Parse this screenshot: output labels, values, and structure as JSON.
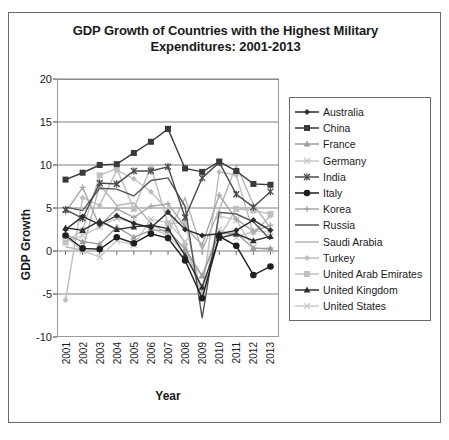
{
  "chart_data": {
    "type": "line",
    "title": "GDP Growth of Countries with the Highest Military Expenditures: 2001-2013",
    "title_line1": "GDP Growth of Countries with the Highest Military",
    "title_line2": "Expenditures: 2001-2013",
    "xlabel": "Year",
    "ylabel": "GDP Growth",
    "grid": true,
    "legend_position": "right",
    "ylim": [
      -10,
      20
    ],
    "yticks": [
      20,
      15,
      10,
      5,
      0,
      -5,
      -10
    ],
    "categories": [
      "2001",
      "2002",
      "2003",
      "2004",
      "2005",
      "2006",
      "2007",
      "2008",
      "2009",
      "2010",
      "2011",
      "2012",
      "2013"
    ],
    "series": [
      {
        "name": "Australia",
        "marker": "diamond",
        "color": "#2b2b2b",
        "values": [
          2.5,
          4.0,
          3.1,
          4.1,
          3.2,
          2.7,
          4.5,
          2.5,
          1.8,
          2.0,
          2.4,
          3.6,
          2.4
        ]
      },
      {
        "name": "China",
        "marker": "square",
        "color": "#3a3a3a",
        "values": [
          8.3,
          9.1,
          10.0,
          10.1,
          11.4,
          12.7,
          14.2,
          9.6,
          9.2,
          10.4,
          9.3,
          7.8,
          7.7
        ]
      },
      {
        "name": "France",
        "marker": "triangle",
        "color": "#9c9c9c",
        "values": [
          1.9,
          1.1,
          0.8,
          2.8,
          1.6,
          2.4,
          2.4,
          0.2,
          -2.9,
          2.0,
          2.1,
          0.3,
          0.3
        ]
      },
      {
        "name": "Germany",
        "marker": "x",
        "color": "#c8c8c8",
        "values": [
          1.7,
          0.0,
          -0.7,
          1.2,
          0.7,
          3.7,
          3.3,
          1.1,
          -5.6,
          4.1,
          3.6,
          0.4,
          0.1
        ]
      },
      {
        "name": "India",
        "marker": "asterisk",
        "color": "#4a4a4a",
        "values": [
          4.8,
          3.8,
          7.9,
          7.8,
          9.3,
          9.3,
          9.8,
          3.9,
          8.5,
          10.3,
          6.6,
          5.1,
          6.9
        ]
      },
      {
        "name": "Italy",
        "marker": "circle",
        "color": "#1f1f1f",
        "values": [
          1.8,
          0.3,
          0.2,
          1.6,
          0.9,
          2.0,
          1.5,
          -1.1,
          -5.5,
          1.7,
          0.6,
          -2.8,
          -1.8
        ]
      },
      {
        "name": "Korea",
        "marker": "plus",
        "color": "#a8a8a8",
        "values": [
          4.5,
          7.4,
          2.9,
          4.9,
          3.9,
          5.2,
          5.5,
          2.8,
          0.7,
          6.5,
          3.7,
          2.3,
          3.0
        ]
      },
      {
        "name": "Russia",
        "marker": "none",
        "color": "#555555",
        "values": [
          5.1,
          4.7,
          7.3,
          7.2,
          6.4,
          8.2,
          8.5,
          5.2,
          -7.8,
          4.5,
          4.3,
          3.4,
          1.3
        ]
      },
      {
        "name": "Saudi Arabia",
        "marker": "none",
        "color": "#b5b5b5",
        "values": [
          0.5,
          0.1,
          7.7,
          5.3,
          5.6,
          3.2,
          2.0,
          6.2,
          0.1,
          4.8,
          10.0,
          5.4,
          2.7
        ]
      },
      {
        "name": "Turkey",
        "marker": "diamond",
        "color": "#bdbdbd",
        "values": [
          -5.7,
          6.2,
          5.3,
          9.4,
          8.4,
          6.9,
          4.7,
          0.7,
          -4.8,
          9.2,
          8.8,
          2.1,
          4.1
        ]
      },
      {
        "name": "United Arab Emirates",
        "marker": "square",
        "color": "#c0c0c0",
        "values": [
          1.0,
          2.4,
          8.8,
          9.6,
          4.9,
          9.8,
          3.2,
          3.3,
          -5.2,
          1.6,
          4.9,
          4.7,
          4.3
        ]
      },
      {
        "name": "United Kingdom",
        "marker": "triangle",
        "color": "#2f2f2f",
        "values": [
          2.7,
          2.4,
          3.5,
          2.5,
          2.8,
          3.0,
          2.6,
          -0.5,
          -4.2,
          1.5,
          2.0,
          1.2,
          1.7
        ]
      },
      {
        "name": "United States",
        "marker": "x",
        "color": "#cccccc",
        "values": [
          1.0,
          1.8,
          2.8,
          3.8,
          3.3,
          2.7,
          1.8,
          -0.3,
          -2.8,
          2.5,
          1.6,
          2.3,
          2.2
        ]
      }
    ]
  }
}
